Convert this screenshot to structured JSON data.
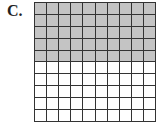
{
  "label": "C.",
  "grid": {
    "rows": 10,
    "cols": 10,
    "shaded_rows": 5,
    "shaded_cells": 50,
    "total_cells": 100,
    "shade_color": "#c4c4c4",
    "line_color": "#333333"
  }
}
